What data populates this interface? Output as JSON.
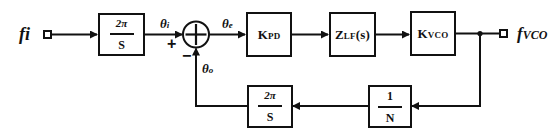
{
  "diagram": {
    "type": "PLL phase-domain block diagram",
    "input": {
      "label": "fi"
    },
    "output": {
      "label": "fVCO",
      "main": "f",
      "sub": "VCO"
    },
    "forward_path": [
      {
        "id": "integrator-in",
        "numerator": "2π",
        "denominator": "S"
      },
      {
        "id": "phase-detector",
        "main": "K",
        "sub": "PD"
      },
      {
        "id": "loop-filter",
        "main": "Z",
        "sub": "LF",
        "suffix": "(s)"
      },
      {
        "id": "vco",
        "main": "K",
        "sub": "VCO"
      }
    ],
    "feedback_path": [
      {
        "id": "divider",
        "numerator": "1",
        "denominator": "N"
      },
      {
        "id": "integrator-fb",
        "numerator": "2π",
        "denominator": "S"
      }
    ],
    "summing_junction": {
      "plus_sign": "+",
      "minus_sign": "−"
    },
    "signals": {
      "theta_i": {
        "main": "θ",
        "sub": "i"
      },
      "theta_e": {
        "main": "θ",
        "sub": "e"
      },
      "theta_o": {
        "main": "θ",
        "sub": "o"
      }
    },
    "colors": {
      "line": "#111111",
      "background": "#ffffff"
    }
  }
}
